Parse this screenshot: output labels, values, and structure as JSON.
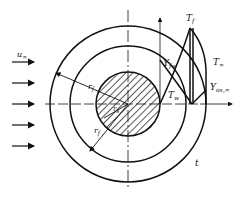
{
  "diagram": {
    "type": "burning-particle-flame-sheet",
    "colors": {
      "stroke": "#111111",
      "background": "#ffffff"
    },
    "labels": {
      "u_inf": {
        "main": "u",
        "sub": "∞"
      },
      "r_s": {
        "main": "r",
        "sub": "s"
      },
      "r_f_upper": {
        "main": "r",
        "sub": "f"
      },
      "r_f_lower": {
        "main": "r",
        "sub": "f"
      },
      "T_f": {
        "main": "T",
        "sub": "f"
      },
      "T_inf": {
        "main": "T",
        "sub": "∞"
      },
      "Y_fw": {
        "main": "Y",
        "sub": "fw"
      },
      "T_w": {
        "main": "T",
        "sub": "w"
      },
      "Y_ox_inf": {
        "main": "Y",
        "sub": "ox,∞"
      },
      "t": {
        "main": "t"
      }
    },
    "flow_arrows": 5
  }
}
